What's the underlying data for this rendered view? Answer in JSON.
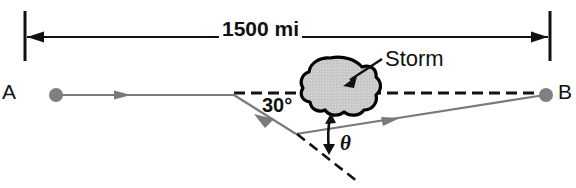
{
  "figure": {
    "labels": {
      "distance": "1500 mi",
      "point_a": "A",
      "point_b": "B",
      "storm": "Storm",
      "angle_known": "30°",
      "angle_unknown": "θ"
    },
    "colors": {
      "path_line": "#7a7a7a",
      "endpoint_dot": "#808080",
      "dimension_line": "#111111",
      "dashed_line": "#111111",
      "storm_fill": "#cccccc",
      "storm_outline": "#000000",
      "background": "#ffffff",
      "text": "#111111"
    },
    "geometry": {
      "dimension_line_y": 37,
      "dimension_left_x": 25,
      "dimension_right_x": 550,
      "point_a": [
        56,
        95
      ],
      "point_b": [
        545,
        95
      ],
      "bend_vertex": [
        234,
        95
      ],
      "turn_vertex": [
        295,
        133
      ],
      "dashed_ab_from": [
        234,
        93
      ],
      "dashed_ab_to": [
        540,
        93
      ],
      "dashed_extension_to": [
        357,
        181
      ],
      "storm_center": [
        340,
        86
      ]
    }
  }
}
